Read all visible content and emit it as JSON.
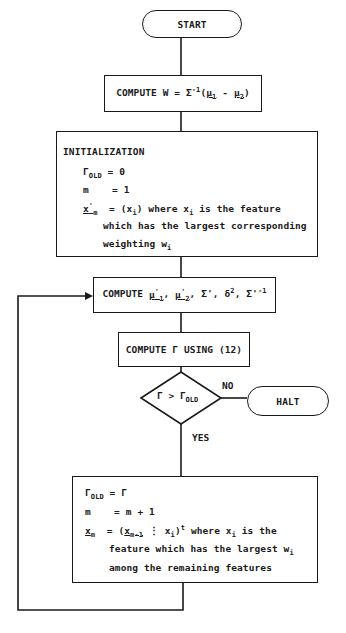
{
  "flowchart": {
    "start": {
      "label": "START"
    },
    "compute_w": {
      "prefix": "COMPUTE W = Σ",
      "sup": "-1",
      "open": "(",
      "mu1": "μ",
      "mu1_sub": "1",
      "minus": " - ",
      "mu2": "μ",
      "mu2_sub": "2",
      "close": ")"
    },
    "initialization": {
      "title": "INITIALIZATION",
      "line1": {
        "sym": "Γ",
        "sub": "OLD",
        "rest": " = 0"
      },
      "line2": {
        "sym": "m",
        "rest": "    = 1"
      },
      "line3": {
        "sym": "x",
        "sup": "'",
        "sub": "m",
        "rest_a": "  = (x",
        "rest_sub": "i",
        "rest_b": ") where x",
        "rest_sub2": "i",
        "rest_c": " is the feature"
      },
      "line4": "which has the largest corresponding",
      "line5": {
        "text": "weighting w",
        "sub": "i"
      }
    },
    "compute_mu": {
      "prefix": "COMPUTE ",
      "mu1": "μ",
      "mu1_sup": "'",
      "mu1_sub": "1",
      "sep1": ", ",
      "mu2": "μ",
      "mu2_sup": "'",
      "mu2_sub": "2",
      "rest_a": ", Σ', δ",
      "delta_sup": "2",
      "rest_b": ", Σ'",
      "inv_sup": "-1"
    },
    "compute_gamma": {
      "label": "COMPUTE Γ USING (12)"
    },
    "decision": {
      "lhs": "Γ > Γ",
      "sub": "OLD"
    },
    "halt": {
      "label": "HALT"
    },
    "edge_no": "NO",
    "edge_yes": "YES",
    "update": {
      "line1": {
        "sym": "Γ",
        "sub": "OLD",
        "rest": " = Γ"
      },
      "line2": {
        "sym": "m",
        "rest": "    = m + 1"
      },
      "line3": {
        "sym": "x",
        "sub": "m",
        "rest_a": "  = (",
        "xm1": "x",
        "xm1_sub": "m-1",
        "rest_b": " ⋮ x",
        "rest_sub": "i",
        "rest_c": ")",
        "t_sup": "t",
        "rest_d": " where x",
        "rest_sub2": "i",
        "rest_e": " is the"
      },
      "line4": {
        "text": "feature which has the largest w",
        "sub": "i"
      },
      "line5": "among the remaining features"
    }
  }
}
